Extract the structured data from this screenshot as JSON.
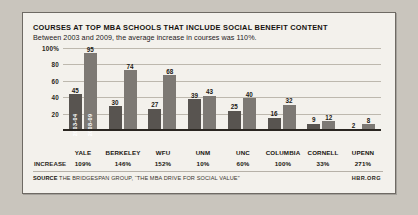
{
  "figure": {
    "title": "COURSES AT TOP MBA SCHOOLS THAT INCLUDE SOCIAL BENEFIT CONTENT",
    "subtitle": "Between 2003 and 2009, the average increase in courses was 110%.",
    "source_label": "SOURCE",
    "source_text": "THE BRIDGESPAN GROUP, “THE MBA DRIVE FOR SOCIAL VALUE”",
    "brand": "HBR.ORG",
    "increase_row_label": "INCREASE"
  },
  "colors": {
    "page_background": "#c9c5bd",
    "card_background": "#f3f1ec",
    "card_border": "#6e6a64",
    "bar_series_1": "#585450",
    "bar_series_2": "#7d7974",
    "gridline": "#bdb8ae",
    "axis": "#2a2621",
    "text": "#16130f"
  },
  "chart_data": {
    "type": "bar",
    "title": "COURSES AT TOP MBA SCHOOLS THAT INCLUDE SOCIAL BENEFIT CONTENT",
    "subtitle": "Between 2003 and 2009, the average increase in courses was 110%.",
    "xlabel": "",
    "ylabel": "",
    "ylim": [
      0,
      100
    ],
    "grid": true,
    "legend_position": "in-bar",
    "categories": [
      "YALE",
      "BERKELEY",
      "WFU",
      "UNM",
      "UNC",
      "COLUMBIA",
      "CORNELL",
      "UPENN"
    ],
    "series": [
      {
        "name": "2003-04",
        "values": [
          45,
          30,
          27,
          39,
          25,
          16,
          9,
          2
        ]
      },
      {
        "name": "2008-09",
        "values": [
          95,
          74,
          68,
          43,
          40,
          32,
          12,
          8
        ]
      }
    ],
    "increase": [
      "109%",
      "146%",
      "152%",
      "10%",
      "60%",
      "100%",
      "33%",
      "271%"
    ],
    "yticks": [
      {
        "value": 100,
        "label": "100%"
      },
      {
        "value": 80,
        "label": "80"
      },
      {
        "value": 60,
        "label": "60"
      },
      {
        "value": 40,
        "label": "40"
      },
      {
        "value": 20,
        "label": "20"
      }
    ]
  }
}
